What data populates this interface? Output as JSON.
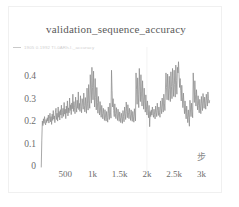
{
  "card": {
    "border_color": "#f0f0f0",
    "background": "#ffffff"
  },
  "chart_title": "validation_sequence_accuracy",
  "legend": {
    "marker_icon": "line-dash-icon",
    "marker_color": "#c9c9c9",
    "label": "1905  0.1992 TI-0ARh.I._accuracy"
  },
  "axis": {
    "x_title": "步",
    "y_ticks": [
      "0.4",
      "0.3",
      "0.2",
      "0.1",
      "0"
    ],
    "x_ticks": [
      "500",
      "1k",
      "1.5k",
      "2k",
      "2.5k",
      "3k"
    ]
  },
  "chart_data": {
    "type": "line",
    "title": "validation_sequence_accuracy",
    "xlabel": "步",
    "ylabel": "",
    "xlim": [
      0,
      3250
    ],
    "ylim": [
      0,
      0.5
    ],
    "grid": false,
    "vertical_gridlines_at": [
      2000
    ],
    "legend_position": "top-left",
    "line_color": "#8c8c8c",
    "series": [
      {
        "name": "validation_sequence_accuracy",
        "x": [
          60,
          70,
          80,
          90,
          100,
          110,
          120,
          130,
          140,
          150,
          160,
          170,
          180,
          190,
          200,
          210,
          220,
          230,
          240,
          250,
          260,
          270,
          280,
          290,
          300,
          310,
          320,
          330,
          340,
          350,
          360,
          370,
          380,
          390,
          400,
          410,
          420,
          430,
          440,
          450,
          460,
          470,
          480,
          490,
          500,
          510,
          520,
          530,
          540,
          550,
          560,
          570,
          580,
          590,
          600,
          610,
          620,
          630,
          640,
          650,
          660,
          670,
          680,
          690,
          700,
          710,
          720,
          730,
          740,
          750,
          760,
          770,
          780,
          790,
          800,
          810,
          820,
          830,
          840,
          850,
          860,
          870,
          880,
          890,
          900,
          910,
          920,
          930,
          940,
          950,
          960,
          970,
          980,
          990,
          1000,
          1010,
          1020,
          1030,
          1040,
          1050,
          1060,
          1070,
          1080,
          1090,
          1100,
          1110,
          1120,
          1130,
          1140,
          1150,
          1160,
          1170,
          1180,
          1190,
          1200,
          1210,
          1220,
          1230,
          1240,
          1250,
          1260,
          1270,
          1280,
          1290,
          1300,
          1310,
          1320,
          1330,
          1340,
          1350,
          1360,
          1370,
          1380,
          1390,
          1400,
          1410,
          1420,
          1430,
          1440,
          1450,
          1460,
          1470,
          1480,
          1490,
          1500,
          1510,
          1520,
          1530,
          1540,
          1550,
          1560,
          1570,
          1580,
          1590,
          1600,
          1610,
          1620,
          1630,
          1640,
          1650,
          1660,
          1670,
          1680,
          1690,
          1700,
          1710,
          1720,
          1730,
          1740,
          1750,
          1760,
          1770,
          1780,
          1790,
          1800,
          1810,
          1820,
          1830,
          1840,
          1850,
          1860,
          1870,
          1880,
          1890,
          1900,
          1910,
          1920,
          1930,
          1940,
          1950,
          1960,
          1970,
          1980,
          1990,
          2000,
          2010,
          2020,
          2030,
          2040,
          2050,
          2060,
          2070,
          2080,
          2090,
          2100,
          2110,
          2120,
          2130,
          2140,
          2150,
          2160,
          2170,
          2180,
          2190,
          2200,
          2210,
          2220,
          2230,
          2240,
          2250,
          2260,
          2270,
          2280,
          2290,
          2300,
          2310,
          2320,
          2330,
          2340,
          2350,
          2360,
          2370,
          2380,
          2390,
          2400,
          2410,
          2420,
          2430,
          2440,
          2450,
          2460,
          2470,
          2480,
          2490,
          2500,
          2510,
          2520,
          2530,
          2540,
          2550,
          2560,
          2570,
          2580,
          2590,
          2600,
          2610,
          2620,
          2630,
          2640,
          2650,
          2660,
          2670,
          2680,
          2690,
          2700,
          2710,
          2720,
          2730,
          2740,
          2750,
          2760,
          2770,
          2780,
          2790,
          2800,
          2810,
          2820,
          2830,
          2840,
          2850,
          2860,
          2870,
          2880,
          2890,
          2900,
          2910,
          2920,
          2930,
          2940,
          2950,
          2960,
          2970,
          2980,
          2990,
          3000,
          3010,
          3020,
          3030,
          3040,
          3050,
          3060,
          3070,
          3080,
          3090,
          3100,
          3110,
          3120,
          3130,
          3140,
          3150
        ],
        "y": [
          0.0,
          0.12,
          0.205,
          0.185,
          0.215,
          0.195,
          0.225,
          0.2,
          0.188,
          0.212,
          0.198,
          0.22,
          0.205,
          0.232,
          0.196,
          0.218,
          0.24,
          0.202,
          0.225,
          0.19,
          0.236,
          0.208,
          0.252,
          0.214,
          0.228,
          0.198,
          0.245,
          0.262,
          0.212,
          0.24,
          0.205,
          0.268,
          0.222,
          0.248,
          0.21,
          0.256,
          0.232,
          0.276,
          0.218,
          0.244,
          0.262,
          0.226,
          0.288,
          0.236,
          0.258,
          0.216,
          0.272,
          0.24,
          0.295,
          0.228,
          0.264,
          0.242,
          0.308,
          0.252,
          0.278,
          0.234,
          0.286,
          0.26,
          0.325,
          0.248,
          0.292,
          0.266,
          0.238,
          0.312,
          0.272,
          0.245,
          0.298,
          0.262,
          0.335,
          0.256,
          0.284,
          0.248,
          0.318,
          0.27,
          0.242,
          0.305,
          0.286,
          0.258,
          0.33,
          0.274,
          0.246,
          0.31,
          0.268,
          0.24,
          0.352,
          0.282,
          0.254,
          0.368,
          0.295,
          0.262,
          0.412,
          0.34,
          0.285,
          0.445,
          0.356,
          0.3,
          0.428,
          0.322,
          0.268,
          0.395,
          0.31,
          0.255,
          0.355,
          0.288,
          0.24,
          0.315,
          0.268,
          0.232,
          0.292,
          0.25,
          0.222,
          0.275,
          0.24,
          0.215,
          0.262,
          0.235,
          0.208,
          0.256,
          0.228,
          0.205,
          0.248,
          0.222,
          0.2,
          0.268,
          0.238,
          0.212,
          0.285,
          0.245,
          0.218,
          0.432,
          0.34,
          0.268,
          0.305,
          0.252,
          0.225,
          0.282,
          0.24,
          0.216,
          0.265,
          0.234,
          0.208,
          0.258,
          0.228,
          0.204,
          0.246,
          0.222,
          0.198,
          0.24,
          0.218,
          0.195,
          0.252,
          0.226,
          0.202,
          0.268,
          0.238,
          0.212,
          0.29,
          0.248,
          0.22,
          0.278,
          0.242,
          0.216,
          0.262,
          0.234,
          0.208,
          0.255,
          0.228,
          0.204,
          0.248,
          0.224,
          0.2,
          0.26,
          0.232,
          0.206,
          0.42,
          0.345,
          0.28,
          0.398,
          0.322,
          0.265,
          0.44,
          0.358,
          0.292,
          0.412,
          0.33,
          0.272,
          0.385,
          0.312,
          0.258,
          0.352,
          0.295,
          0.245,
          0.322,
          0.272,
          0.232,
          0.295,
          0.255,
          0.22,
          0.275,
          0.18,
          0.248,
          0.225,
          0.255,
          0.232,
          0.268,
          0.24,
          0.222,
          0.258,
          0.235,
          0.215,
          0.272,
          0.245,
          0.225,
          0.285,
          0.252,
          0.23,
          0.268,
          0.242,
          0.222,
          0.295,
          0.262,
          0.238,
          0.308,
          0.272,
          0.245,
          0.325,
          0.285,
          0.252,
          0.348,
          0.42,
          0.355,
          0.3,
          0.415,
          0.352,
          0.298,
          0.405,
          0.345,
          0.292,
          0.425,
          0.36,
          0.305,
          0.44,
          0.372,
          0.315,
          0.432,
          0.368,
          0.312,
          0.455,
          0.385,
          0.325,
          0.445,
          0.42,
          0.47,
          0.412,
          0.355,
          0.395,
          0.34,
          0.295,
          0.365,
          0.312,
          0.265,
          0.33,
          0.282,
          0.238,
          0.295,
          0.25,
          0.215,
          0.272,
          0.232,
          0.198,
          0.255,
          0.222,
          0.182,
          0.298,
          0.255,
          0.225,
          0.285,
          0.248,
          0.22,
          0.42,
          0.348,
          0.288,
          0.385,
          0.322,
          0.272,
          0.345,
          0.295,
          0.255,
          0.318,
          0.275,
          0.242,
          0.302,
          0.268,
          0.238,
          0.315,
          0.282,
          0.252,
          0.328,
          0.295,
          0.262,
          0.312,
          0.285,
          0.258,
          0.325,
          0.298,
          0.272,
          0.335,
          0.305,
          0.285,
          0.296
        ]
      }
    ]
  }
}
